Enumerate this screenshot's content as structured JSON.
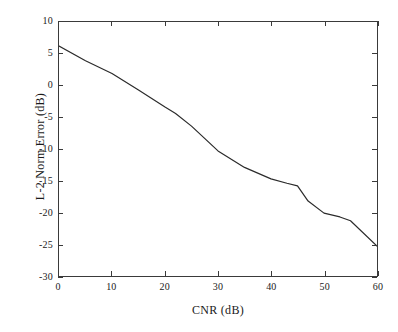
{
  "chart_data": {
    "type": "line",
    "title": "",
    "subtitle": "",
    "xlabel": "CNR (dB)",
    "ylabel": "L-2 Norm Error (dB)",
    "xlim": [
      0,
      60
    ],
    "ylim": [
      -30,
      10
    ],
    "xticks": [
      0,
      10,
      20,
      30,
      40,
      50,
      60
    ],
    "yticks": [
      10,
      5,
      0,
      -5,
      -10,
      -15,
      -20,
      -25,
      -30
    ],
    "xticklabels": [
      "0",
      "10",
      "20",
      "30",
      "40",
      "50",
      "60"
    ],
    "yticklabels": [
      "10",
      "5",
      "0",
      "-5",
      "-10",
      "-15",
      "-20",
      "-25",
      "-30"
    ],
    "grid": false,
    "legend": null,
    "legend_position": "none",
    "line_color": "#2b2b2b",
    "line_width": 1.2,
    "axes_color": "#3a3a3a",
    "background_color": "#ffffff",
    "series": [
      {
        "name": "L-2 Norm Error",
        "x": [
          0,
          5,
          10,
          15,
          20,
          22,
          25,
          30,
          35,
          40,
          43,
          45,
          47,
          50,
          53,
          55,
          60
        ],
        "y": [
          6.2,
          3.9,
          1.9,
          -0.7,
          -3.4,
          -4.4,
          -6.4,
          -10.3,
          -12.9,
          -14.7,
          -15.4,
          -15.8,
          -18.2,
          -20.1,
          -20.7,
          -21.3,
          -25.3
        ]
      }
    ]
  }
}
